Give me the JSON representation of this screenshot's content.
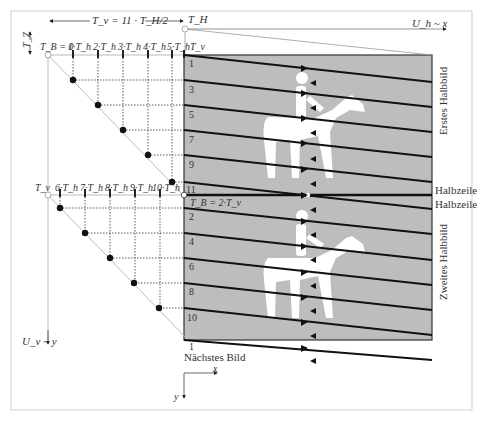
{
  "header": {
    "frame_period_label": "T_v = 11 · T_H/2",
    "t_h_label": "T_H",
    "x_axis_label": "U_h ~ x",
    "y_axis_label": "U_v ~ y",
    "tz_label": "T_Z",
    "tv_label": "T_v"
  },
  "first_field": {
    "origin_label": "T_B = 0",
    "tick_labels": [
      "1·T_h",
      "2·T_h",
      "3·T_h",
      "4·T_h",
      "5·T_h"
    ],
    "line_numbers": [
      "1",
      "3",
      "5",
      "7",
      "9",
      "11"
    ],
    "side_label": "Erstes Halbbild"
  },
  "second_field": {
    "origin_label": "T_v",
    "tick_labels": [
      "6·T_h",
      "7·T_h",
      "8·T_h",
      "9·T_h",
      "10·T_h"
    ],
    "line_numbers": [
      "2",
      "4",
      "6",
      "8",
      "10"
    ],
    "tb_label": "T_B = 2·T_v",
    "side_label": "Zweites Halbbild"
  },
  "halfline_labels": [
    "Halbzeile",
    "Halbzeile"
  ],
  "next_frame": {
    "line_number": "1",
    "label": "Nächstes Bild"
  },
  "axes_legend": {
    "x": "x",
    "y": "y"
  },
  "colors": {
    "field_gray": "#bdbdbd",
    "line": "#111111",
    "frame": "#cccccc",
    "guide": "#c8c8c8"
  }
}
